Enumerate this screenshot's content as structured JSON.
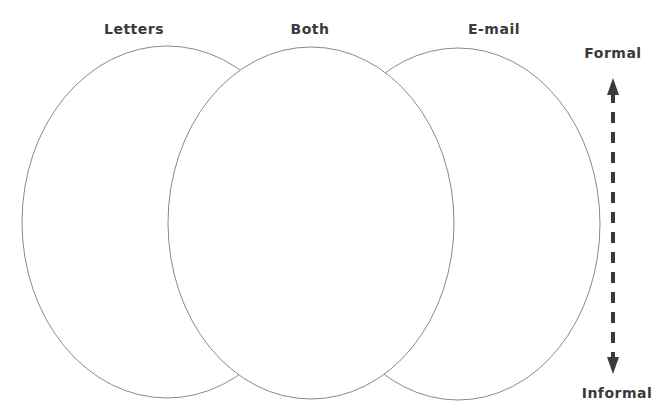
{
  "diagram": {
    "type": "venn-3-ellipse",
    "circles": [
      {
        "id": "letters",
        "label": "Letters",
        "cx": 167,
        "cy": 222,
        "rx": 145,
        "ry": 176
      },
      {
        "id": "both",
        "label": "Both",
        "cx": 311,
        "cy": 223,
        "rx": 143,
        "ry": 176
      },
      {
        "id": "email",
        "label": "E-mail",
        "cx": 458,
        "cy": 224,
        "rx": 142,
        "ry": 176
      }
    ],
    "headings": {
      "letters": "Letters",
      "both": "Both",
      "email": "E-mail"
    },
    "scale": {
      "top_label": "Formal",
      "bottom_label": "Informal",
      "style": "dashed double-headed arrow"
    },
    "colors": {
      "outline": "#8a8a8a",
      "text": "#3a3a3a",
      "arrow": "#3a3a3a",
      "background": "#ffffff"
    }
  }
}
